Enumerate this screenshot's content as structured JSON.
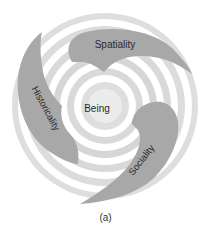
{
  "diagram": {
    "center_label": "Being",
    "blades": [
      {
        "id": "spatiality",
        "label": "Spatiality"
      },
      {
        "id": "historicality",
        "label": "Historicality"
      },
      {
        "id": "sociality",
        "label": "Sociality"
      }
    ],
    "caption": "(a)",
    "colors": {
      "ring_light": "#dcdcdc",
      "ring_white": "#ffffff",
      "blade": "#a6a6a6",
      "text": "#2a2a2a"
    }
  }
}
